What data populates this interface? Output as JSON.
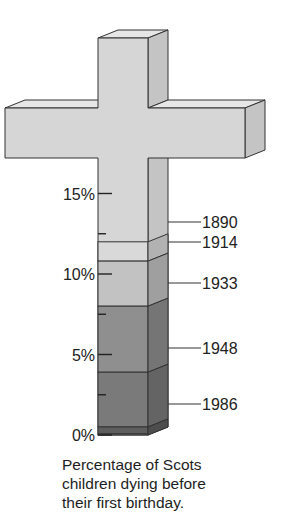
{
  "chart_data": {
    "type": "bar",
    "style": "pictorial 3D cross, stacked bands in stem",
    "title": "",
    "caption": "Percentage of Scots children dying before their first birthday.",
    "ylabel": "Percentage",
    "ylim": [
      0,
      15
    ],
    "yticks": [
      {
        "value": 15,
        "label": "15%"
      },
      {
        "value": 10,
        "label": "10%"
      },
      {
        "value": 5,
        "label": "5%"
      },
      {
        "value": 0,
        "label": "0%"
      }
    ],
    "minor_ticks": [
      12.5,
      7.5,
      2.5
    ],
    "categories": [
      "1890",
      "1914",
      "1933",
      "1948",
      "1986"
    ],
    "values": [
      12.0,
      10.8,
      8.0,
      3.9,
      0.5
    ],
    "band_colors": [
      "#d9d9d9",
      "#c2c2c2",
      "#8f8f8f",
      "#7a7a7a",
      "#5e5e5e"
    ],
    "cross_color": "#d6d6d6",
    "grid": false,
    "legend": "leader-line labels to the right of stem"
  },
  "caption_lines": [
    "Percentage of Scots",
    "children dying before",
    "their first birthday."
  ]
}
